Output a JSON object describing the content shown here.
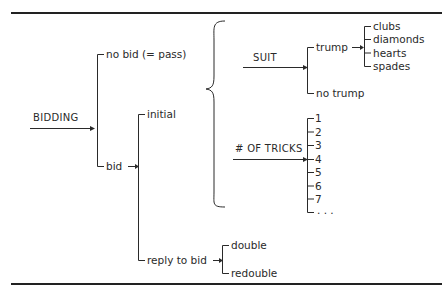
{
  "diagram": {
    "root": "BIDDING",
    "level1": {
      "no_bid": "no bid (= pass)",
      "bid": "bid"
    },
    "level2": {
      "initial": "initial",
      "reply": "reply to bid"
    },
    "reply_options": [
      "double",
      "redouble"
    ],
    "initial_components": {
      "suit": {
        "label": "SUIT",
        "trump": "trump",
        "no_trump": "no trump",
        "suits": [
          "clubs",
          "diamonds",
          "hearts",
          "spades"
        ]
      },
      "tricks": {
        "label": "# OF TRICKS",
        "values": [
          "1",
          "2",
          "3",
          "4",
          "5",
          "6",
          "7",
          ". . ."
        ]
      }
    },
    "colors": {
      "line": "#2a2a2a",
      "rule": "#222222",
      "background": "#ffffff"
    }
  }
}
